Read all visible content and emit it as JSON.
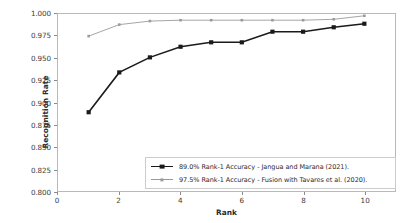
{
  "chart_data": {
    "type": "line",
    "title": "",
    "xlabel": "Rank",
    "ylabel": "Recognition Rate",
    "xlim": [
      0,
      11
    ],
    "ylim": [
      0.8,
      1.0
    ],
    "xticks": [
      0,
      2,
      4,
      6,
      8,
      10
    ],
    "xtick_labels": [
      "0",
      "2",
      "4",
      "6",
      "8",
      "10"
    ],
    "yticks": [
      0.8,
      0.825,
      0.85,
      0.875,
      0.9,
      0.925,
      0.95,
      0.975,
      1.0
    ],
    "ytick_labels": [
      "0.800",
      "0.825",
      "0.850",
      "0.875",
      "0.900",
      "0.925",
      "0.950",
      "0.975",
      "1.000"
    ],
    "grid": false,
    "legend_position": "lower center",
    "x": [
      1,
      2,
      3,
      4,
      5,
      6,
      7,
      8,
      9,
      10
    ],
    "series": [
      {
        "name": "89.0% Rank-1 Accuracy - Jangua and Marana (2021).",
        "color": "#1a1a1a",
        "marker": "square",
        "marker_size": 4.2,
        "line_width": 1.6,
        "values": [
          0.889,
          0.934,
          0.951,
          0.963,
          0.968,
          0.968,
          0.98,
          0.98,
          0.985,
          0.989
        ]
      },
      {
        "name": "97.5% Rank-1 Accuracy - Fusion with Tavares et al. (2020).",
        "color": "#9a9a9a",
        "marker": "square",
        "marker_size": 2.6,
        "line_width": 0.9,
        "values": [
          0.975,
          0.988,
          0.992,
          0.993,
          0.993,
          0.993,
          0.993,
          0.993,
          0.994,
          0.998
        ]
      }
    ]
  }
}
